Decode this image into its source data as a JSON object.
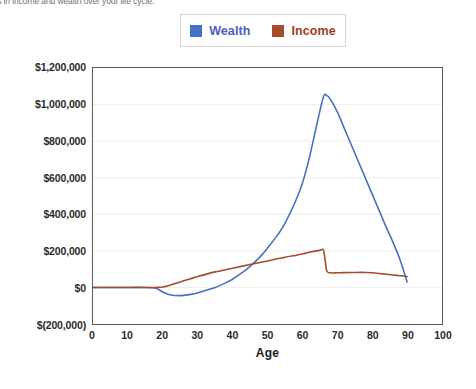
{
  "caption": {
    "text": "hanges in income and wealth over your life cycle."
  },
  "legend": {
    "position": "top-center",
    "entries": [
      {
        "label": "Wealth",
        "color": "#4472C4"
      },
      {
        "label": "Income",
        "color": "#A84B2A"
      }
    ]
  },
  "axes": {
    "x_title": "Age",
    "x_ticks": [
      "0",
      "10",
      "20",
      "30",
      "40",
      "50",
      "60",
      "70",
      "80",
      "90",
      "100"
    ],
    "y_ticks": [
      "$1,200,000",
      "$1,000,000",
      "$800,000",
      "$600,000",
      "$400,000",
      "$200,000",
      "$0",
      "$(200,000)"
    ]
  },
  "chart_data": {
    "type": "line",
    "title": "",
    "subtitle": "",
    "xlabel": "Age",
    "ylabel": "",
    "xlim": [
      0,
      100
    ],
    "ylim": [
      -200000,
      1200000
    ],
    "xticks": [
      0,
      10,
      20,
      30,
      40,
      50,
      60,
      70,
      80,
      90,
      100
    ],
    "yticks": [
      -200000,
      0,
      200000,
      400000,
      600000,
      800000,
      1000000,
      1200000
    ],
    "ytick_labels": [
      "$(200,000)",
      "$0",
      "$200,000",
      "$400,000",
      "$600,000",
      "$800,000",
      "$1,000,000",
      "$1,200,000"
    ],
    "grid": "horizontal",
    "legend_position": "top-center",
    "series": [
      {
        "name": "Wealth",
        "color": "#4472C4",
        "x": [
          0,
          5,
          10,
          15,
          18,
          20,
          22,
          25,
          28,
          30,
          32,
          35,
          38,
          40,
          43,
          45,
          48,
          50,
          53,
          55,
          58,
          60,
          62,
          64,
          66,
          67,
          68,
          70,
          72,
          74,
          76,
          78,
          80,
          82,
          84,
          86,
          88,
          90
        ],
        "y": [
          0,
          0,
          0,
          0,
          -5000,
          -25000,
          -40000,
          -45000,
          -38000,
          -30000,
          -18000,
          0,
          25000,
          45000,
          85000,
          115000,
          170000,
          215000,
          290000,
          350000,
          470000,
          570000,
          710000,
          880000,
          1040000,
          1050000,
          1030000,
          960000,
          870000,
          780000,
          690000,
          600000,
          510000,
          420000,
          330000,
          245000,
          150000,
          30000
        ]
      },
      {
        "name": "Income",
        "color": "#A84B2A",
        "x": [
          0,
          5,
          10,
          15,
          18,
          20,
          22,
          25,
          28,
          30,
          35,
          40,
          45,
          50,
          55,
          58,
          60,
          62,
          64,
          65,
          66,
          66.5,
          67,
          68,
          70,
          72,
          75,
          78,
          80,
          82,
          84,
          86,
          88,
          90
        ],
        "y": [
          0,
          0,
          0,
          0,
          0,
          2000,
          12000,
          30000,
          48000,
          60000,
          85000,
          105000,
          125000,
          145000,
          165000,
          175000,
          183000,
          192000,
          200000,
          203000,
          205000,
          150000,
          90000,
          80000,
          80000,
          81000,
          82000,
          82000,
          80000,
          76000,
          72000,
          68000,
          64000,
          60000
        ]
      }
    ]
  },
  "colors": {
    "wealth": "#4472C4",
    "income": "#A84B2A",
    "grid": "#EDEDED",
    "frame": "#595959",
    "background": "#FFFFFF"
  }
}
